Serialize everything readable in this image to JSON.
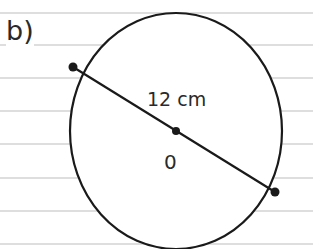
{
  "question_label": "b)",
  "diameter_label": "12 cm",
  "center_label": "0",
  "colors": {
    "line": "#1a1a1a",
    "rule": "#b8b8b8"
  }
}
